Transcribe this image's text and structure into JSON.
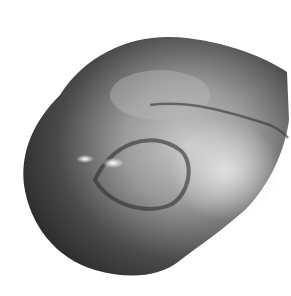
{
  "image": {
    "subject": "polished stone",
    "colors": {
      "background": "#ffffff",
      "dark": "#2a2a2a",
      "mid": "#6a6a6a",
      "light": "#c8c8c8",
      "highlight": "#ffffff"
    }
  }
}
